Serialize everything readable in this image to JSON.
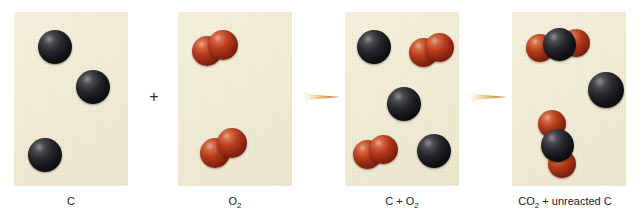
{
  "figure": {
    "background_color": "#ffffff",
    "panel_color": "#f1ecd6",
    "plus_symbol": "+",
    "atom_colors": {
      "carbon": "#131317",
      "oxygen": "#b63c1c"
    },
    "arrow_color": "#c8812f"
  },
  "panels": [
    {
      "id": "reactant-carbon",
      "label": "C",
      "label_parts": [
        {
          "text": "C",
          "sub": ""
        }
      ],
      "contents": "3 carbon atoms",
      "species": [
        {
          "type": "C",
          "atoms": [
            {
              "element": "C",
              "x": 24,
              "y": 18,
              "r": 17
            }
          ]
        },
        {
          "type": "C",
          "atoms": [
            {
              "element": "C",
              "x": 62,
              "y": 58,
              "r": 17
            }
          ]
        },
        {
          "type": "C",
          "atoms": [
            {
              "element": "C",
              "x": 14,
              "y": 126,
              "r": 17
            }
          ]
        }
      ]
    },
    {
      "id": "reactant-oxygen",
      "label": "O2",
      "label_parts": [
        {
          "text": "O",
          "sub": "2"
        }
      ],
      "contents": "2 oxygen molecules",
      "species": [
        {
          "type": "O2",
          "atoms": [
            {
              "element": "O",
              "x": 20,
              "y": 24,
              "r": 15
            },
            {
              "element": "O",
              "x": 36,
              "y": 18,
              "r": 15
            }
          ]
        },
        {
          "type": "O2",
          "atoms": [
            {
              "element": "O",
              "x": 26,
              "y": 128,
              "r": 15
            },
            {
              "element": "O",
              "x": 42,
              "y": 118,
              "r": 15
            }
          ]
        }
      ]
    },
    {
      "id": "mixture",
      "label": "C + O2",
      "label_parts": [
        {
          "text": "C + O",
          "sub": "2"
        }
      ],
      "contents": "3 carbon atoms and 2 oxygen molecules mixed",
      "species": [
        {
          "type": "C",
          "atoms": [
            {
              "element": "C",
              "x": 12,
              "y": 18,
              "r": 17
            }
          ]
        },
        {
          "type": "O2",
          "atoms": [
            {
              "element": "O",
              "x": 70,
              "y": 26,
              "r": 15
            },
            {
              "element": "O",
              "x": 86,
              "y": 22,
              "r": 15
            }
          ]
        },
        {
          "type": "C",
          "atoms": [
            {
              "element": "C",
              "x": 42,
              "y": 75,
              "r": 17
            }
          ]
        },
        {
          "type": "O2",
          "atoms": [
            {
              "element": "O",
              "x": 14,
              "y": 128,
              "r": 15
            },
            {
              "element": "O",
              "x": 30,
              "y": 124,
              "r": 15
            }
          ]
        },
        {
          "type": "C",
          "atoms": [
            {
              "element": "C",
              "x": 76,
              "y": 125,
              "r": 17
            }
          ]
        }
      ]
    },
    {
      "id": "products",
      "label": "CO2 + unreacted C",
      "label_parts": [
        {
          "text": "CO",
          "sub": "2"
        },
        {
          "text": " + unreacted C",
          "sub": ""
        }
      ],
      "contents": "2 carbon dioxide molecules and 1 unreacted carbon atom",
      "species": [
        {
          "type": "CO2",
          "atoms": [
            {
              "element": "O",
              "x": 16,
              "y": 20,
              "r": 14
            },
            {
              "element": "C",
              "x": 31,
              "y": 14,
              "r": 17
            },
            {
              "element": "O",
              "x": 52,
              "y": 17,
              "r": 14
            }
          ]
        },
        {
          "type": "C",
          "atoms": [
            {
              "element": "C",
              "x": 82,
              "y": 62,
              "r": 18
            }
          ]
        },
        {
          "type": "CO2",
          "atoms": [
            {
              "element": "O",
              "x": 28,
              "y": 102,
              "r": 14
            },
            {
              "element": "C",
              "x": 34,
              "y": 120,
              "r": 17
            },
            {
              "element": "O",
              "x": 44,
              "y": 142,
              "r": 14
            }
          ]
        }
      ]
    }
  ],
  "connectors": [
    {
      "id": "plus",
      "symbol": "+",
      "kind": "plus"
    },
    {
      "id": "arrow-1",
      "symbol": "→",
      "kind": "reaction-arrow"
    },
    {
      "id": "arrow-2",
      "symbol": "→",
      "kind": "reaction-arrow"
    }
  ]
}
